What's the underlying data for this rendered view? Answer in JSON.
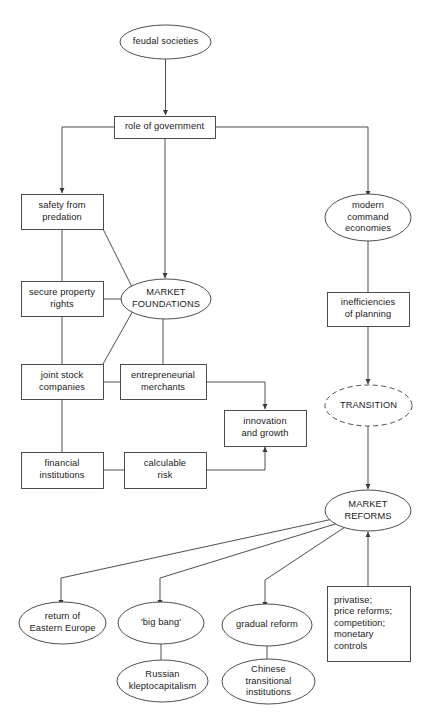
{
  "diagram": {
    "type": "flowchart",
    "canvas": {
      "width": 431,
      "height": 725
    },
    "style": {
      "stroke": "#3a3a3a",
      "text_color": "#1a1a1a",
      "background": "#ffffff",
      "node_fill": "#ffffff"
    },
    "nodes": [
      {
        "id": "feudal-societies",
        "label": "feudal societies",
        "shape": "ellipse",
        "x": 120,
        "y": 25,
        "w": 91,
        "h": 34
      },
      {
        "id": "role-of-government",
        "label": "role of government",
        "shape": "rect",
        "x": 114,
        "y": 116,
        "w": 101,
        "h": 22
      },
      {
        "id": "safety-from-predation",
        "label": "safety from\npredation",
        "shape": "rect",
        "x": 21,
        "y": 194,
        "w": 82,
        "h": 35
      },
      {
        "id": "secure-property-rights",
        "label": "secure property\nrights",
        "shape": "rect",
        "x": 21,
        "y": 281,
        "w": 82,
        "h": 35
      },
      {
        "id": "market-foundations",
        "label": "MARKET\nFOUNDATIONS",
        "shape": "ellipse",
        "x": 121,
        "y": 279,
        "w": 90,
        "h": 40
      },
      {
        "id": "joint-stock-companies",
        "label": "joint stock\ncompanies",
        "shape": "rect",
        "x": 21,
        "y": 364,
        "w": 82,
        "h": 35
      },
      {
        "id": "entrepreneurial-merchants",
        "label": "entrepreneurial\nmerchants",
        "shape": "rect",
        "x": 120,
        "y": 364,
        "w": 86,
        "h": 35
      },
      {
        "id": "innovation-and-growth",
        "label": "innovation\nand growth",
        "shape": "rect",
        "x": 224,
        "y": 410,
        "w": 82,
        "h": 36
      },
      {
        "id": "financial-institutions",
        "label": "financial\ninstitutions",
        "shape": "rect",
        "x": 21,
        "y": 452,
        "w": 82,
        "h": 36
      },
      {
        "id": "calculable-risk",
        "label": "calculable\nrisk",
        "shape": "rect",
        "x": 124,
        "y": 452,
        "w": 82,
        "h": 36
      },
      {
        "id": "modern-command-economies",
        "label": "modern\ncommand\neconomies",
        "shape": "ellipse",
        "x": 325,
        "y": 194,
        "w": 86,
        "h": 47
      },
      {
        "id": "inefficiencies-of-planning",
        "label": "inefficiencies\nof planning",
        "shape": "rect",
        "x": 327,
        "y": 292,
        "w": 82,
        "h": 34
      },
      {
        "id": "transition",
        "label": "TRANSITION",
        "shape": "ellipse-dashed",
        "x": 325,
        "y": 385,
        "w": 87,
        "h": 41
      },
      {
        "id": "market-reforms",
        "label": "MARKET\nREFORMS",
        "shape": "ellipse",
        "x": 325,
        "y": 490,
        "w": 86,
        "h": 41
      },
      {
        "id": "return-of-eastern-europe",
        "label": "return of\nEastern Europe",
        "shape": "ellipse",
        "x": 19,
        "y": 602,
        "w": 87,
        "h": 42
      },
      {
        "id": "big-bang",
        "label": "'big bang'",
        "shape": "ellipse",
        "x": 118,
        "y": 602,
        "w": 86,
        "h": 42
      },
      {
        "id": "gradual-reform",
        "label": "gradual reform",
        "shape": "ellipse",
        "x": 222,
        "y": 604,
        "w": 90,
        "h": 42
      },
      {
        "id": "privatise-measures",
        "label": "privatise;\nprice reforms;\ncompetition;\nmonetary\ncontrols",
        "shape": "rect",
        "x": 327,
        "y": 586,
        "w": 83,
        "h": 75
      },
      {
        "id": "russian-kleptocapitalism",
        "label": "Russian\nkleptocapitalism",
        "shape": "ellipse",
        "x": 117,
        "y": 660,
        "w": 91,
        "h": 42
      },
      {
        "id": "chinese-transitional-institutions",
        "label": "Chinese\ntransitional\ninstitutions",
        "shape": "ellipse",
        "x": 222,
        "y": 659,
        "w": 93,
        "h": 45
      }
    ],
    "edges": [
      {
        "from": "feudal-societies",
        "to": "role-of-government",
        "arrow": true
      },
      {
        "from": "role-of-government",
        "to": "safety-from-predation",
        "arrow": true
      },
      {
        "from": "role-of-government",
        "to": "market-foundations",
        "arrow": true
      },
      {
        "from": "role-of-government",
        "to": "modern-command-economies",
        "arrow": true
      },
      {
        "from": "safety-from-predation",
        "to": "secure-property-rights",
        "arrow": false
      },
      {
        "from": "safety-from-predation",
        "to": "market-foundations",
        "arrow": false
      },
      {
        "from": "secure-property-rights",
        "to": "market-foundations",
        "arrow": false
      },
      {
        "from": "secure-property-rights",
        "to": "joint-stock-companies",
        "arrow": false
      },
      {
        "from": "joint-stock-companies",
        "to": "market-foundations",
        "arrow": false
      },
      {
        "from": "market-foundations",
        "to": "entrepreneurial-merchants",
        "arrow": false
      },
      {
        "from": "joint-stock-companies",
        "to": "entrepreneurial-merchants",
        "arrow": false
      },
      {
        "from": "joint-stock-companies",
        "to": "financial-institutions",
        "arrow": false
      },
      {
        "from": "entrepreneurial-merchants",
        "to": "innovation-and-growth",
        "arrow": true
      },
      {
        "from": "financial-institutions",
        "to": "calculable-risk",
        "arrow": false
      },
      {
        "from": "calculable-risk",
        "to": "innovation-and-growth",
        "arrow": true
      },
      {
        "from": "modern-command-economies",
        "to": "inefficiencies-of-planning",
        "arrow": false
      },
      {
        "from": "inefficiencies-of-planning",
        "to": "transition",
        "arrow": true
      },
      {
        "from": "transition",
        "to": "market-reforms",
        "arrow": true
      },
      {
        "from": "market-reforms",
        "to": "return-of-eastern-europe",
        "arrow": true
      },
      {
        "from": "market-reforms",
        "to": "big-bang",
        "arrow": true
      },
      {
        "from": "market-reforms",
        "to": "gradual-reform",
        "arrow": true
      },
      {
        "from": "privatise-measures",
        "to": "market-reforms",
        "arrow": true
      },
      {
        "from": "big-bang",
        "to": "russian-kleptocapitalism",
        "arrow": false
      },
      {
        "from": "gradual-reform",
        "to": "chinese-transitional-institutions",
        "arrow": false
      }
    ]
  }
}
